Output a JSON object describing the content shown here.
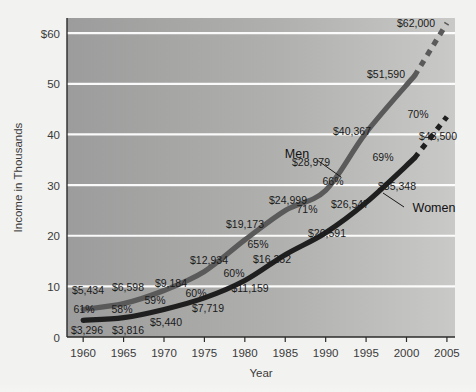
{
  "chart_data": {
    "type": "line",
    "title": "",
    "xlabel": "Year",
    "ylabel": "Income in Thousands",
    "xlim": [
      1958,
      2006
    ],
    "ylim": [
      0,
      63
    ],
    "grid": true,
    "legend": "inline-labels",
    "x": [
      1960,
      1965,
      1970,
      1975,
      1980,
      1985,
      1990,
      1995,
      2001,
      2005
    ],
    "x_tick_labels": [
      "1960",
      "1965",
      "1970",
      "1975",
      "1980",
      "1985",
      "1990",
      "1995",
      "2000",
      "2005"
    ],
    "x_ticks": [
      1960,
      1965,
      1970,
      1975,
      1980,
      1985,
      1990,
      1995,
      2000,
      2005
    ],
    "y_ticks": [
      0,
      10,
      20,
      30,
      40,
      50,
      60
    ],
    "y_tick_labels": [
      "0",
      "10",
      "20",
      "30",
      "40",
      "50",
      "$60"
    ],
    "series": [
      {
        "name": "Men",
        "values": [
          5434,
          6598,
          9184,
          12934,
          19173,
          24999,
          28979,
          40367,
          51590,
          62000
        ],
        "labels": [
          "$5,434",
          "$6,598",
          "$9,184",
          "$12,934",
          "$19,173",
          "$24,999",
          "$28,979",
          "$40,367",
          "$51,590",
          "$62,000"
        ],
        "color": "#5a5a5a",
        "projected_from": 2001
      },
      {
        "name": "Women",
        "values": [
          3296,
          3816,
          5440,
          7719,
          11159,
          16252,
          20591,
          26547,
          35348,
          43500
        ],
        "labels": [
          "$3,296",
          "$3,816",
          "$5,440",
          "$7,719",
          "$11,159",
          "$16,252",
          "$20,591",
          "$26,547",
          "$35,348",
          "$43,500"
        ],
        "color": "#1f1f1f",
        "projected_from": 2001
      }
    ],
    "ratio_annotations": {
      "description": "Women's income as percent of men's income",
      "labels": [
        "61%",
        "58%",
        "59%",
        "60%",
        "60%",
        "65%",
        "71%",
        "66%",
        "69%",
        "70%"
      ],
      "values": [
        61,
        58,
        59,
        60,
        60,
        65,
        71,
        66,
        69,
        70
      ]
    }
  },
  "axes": {
    "y_title": "Income in Thousands",
    "x_title": "Year"
  },
  "series_labels": {
    "men": "Men",
    "women": "Women"
  },
  "colors": {
    "men_line": "#5a5a5a",
    "women_line": "#1f1f1f",
    "plot_bg_left": "#9c9c9c",
    "plot_bg_right": "#c9c9c7",
    "gridline": "#ffffff",
    "page_bg": "#f2f2f0",
    "text": "#2b2b2b"
  },
  "footer": {
    "smudge_text": ""
  }
}
